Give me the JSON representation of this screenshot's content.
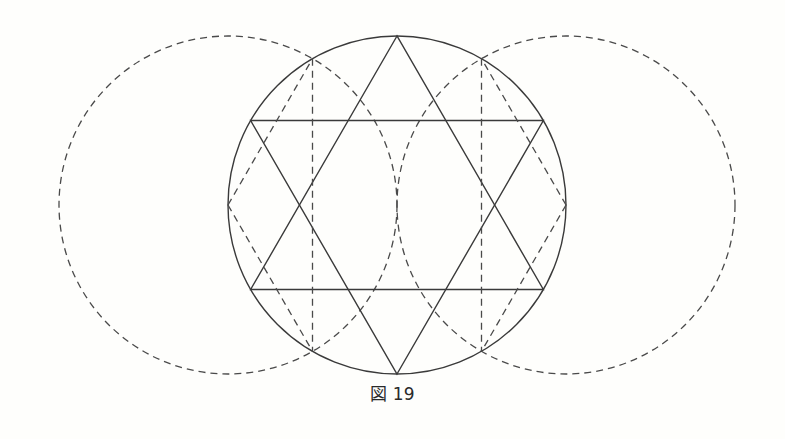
{
  "figure": {
    "caption": "図 19",
    "colors": {
      "background": "#fefefc",
      "line": "#3a3a3a",
      "dashed_line": "#4a4a4a"
    },
    "elements": {
      "main_circle": "solid",
      "left_construction_circle": "dashed",
      "right_construction_circle": "dashed",
      "hexagram": "solid",
      "construction_lines": "dashed"
    }
  }
}
